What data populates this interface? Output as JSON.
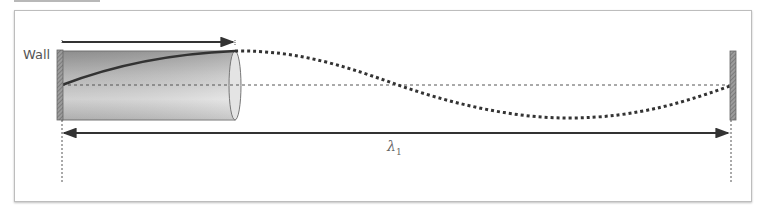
{
  "diagram": {
    "type": "standing-wave-tube",
    "labels": {
      "wall": "Wall",
      "wavelength_symbol": "λ",
      "wavelength_subscript": "1"
    },
    "elements": {
      "left_wall": {
        "x": 60,
        "y_top": 50,
        "y_bottom": 120
      },
      "right_wall": {
        "x": 733,
        "y_top": 51,
        "y_bottom": 120
      },
      "tube": {
        "x_start": 62,
        "x_end": 235,
        "y_top": 51,
        "y_bottom": 120
      },
      "center_line_y": 85,
      "top_arrow": {
        "x_start": 62,
        "x_end": 233,
        "y": 42
      },
      "wavelength_arrow": {
        "x_start": 63,
        "x_end": 728,
        "y": 133
      }
    },
    "colors": {
      "tube_dark": "#8f8f8f",
      "tube_light": "#e6e6e6",
      "wave": "#333333",
      "frame": "#bdbdbd"
    }
  }
}
